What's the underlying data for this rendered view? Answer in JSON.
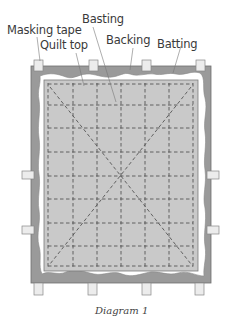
{
  "labels": {
    "masking_tape": "Masking tape",
    "quilt_top": "Quilt top",
    "basting": "Basting",
    "backing": "Backing",
    "batting": "Batting"
  },
  "caption": "Diagram 1",
  "colors": {
    "backing": "#9a9a9a",
    "backing_stroke": "#6f6f6f",
    "batting": "#ffffff",
    "quilt_top": "#c9c9c9",
    "quilt_top_stroke": "#7a7a7a",
    "basting": "#555555",
    "tape_fill": "#ececec",
    "tape_stroke": "#888888",
    "leader": "#777777"
  },
  "layers": [
    "Backing",
    "Batting",
    "Quilt top",
    "Basting",
    "Masking tape"
  ]
}
